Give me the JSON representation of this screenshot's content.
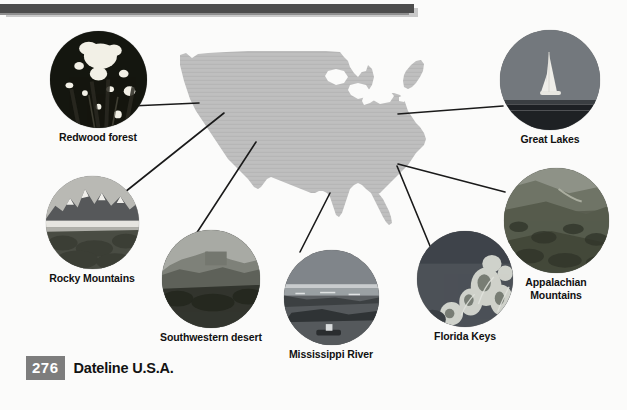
{
  "page": {
    "number": "276",
    "title": "Dateline U.S.A.",
    "map_region_name": "United States"
  },
  "colors": {
    "map_fill": "#bfbfbf",
    "rule_dark": "#4d4d4d",
    "rule_light": "#c9c9c9",
    "page_number_bg": "#7d7d7d",
    "page_number_text": "#ffffff",
    "caption_text": "#111111",
    "background": "#fbfbfa",
    "leader_line": "#1a1a1a"
  },
  "callouts": [
    {
      "id": "redwood-forest",
      "label": "Redwood forest",
      "image_alt": "Looking up at tall redwood trees with sunlight through the canopy"
    },
    {
      "id": "great-lakes",
      "label": "Great Lakes",
      "image_alt": "Sailboat on open water at dusk"
    },
    {
      "id": "rocky-mountains",
      "label": "Rocky Mountains",
      "image_alt": "Snow-capped jagged peaks above a valley and river"
    },
    {
      "id": "appalachian-mountains",
      "label": "Appalachian\nMountains",
      "label_line1": "Appalachian",
      "label_line2": "Mountains",
      "image_alt": "Forested rolling ridges of the Appalachian range"
    },
    {
      "id": "southwestern-desert",
      "label": "Southwestern desert",
      "image_alt": "Desert mesas and buttes in haze"
    },
    {
      "id": "mississippi-river",
      "label": "Mississippi River",
      "image_alt": "Wide river with sandbars and a barge"
    },
    {
      "id": "florida-keys",
      "label": "Florida Keys",
      "image_alt": "Underwater coral reef with sea fans"
    }
  ]
}
